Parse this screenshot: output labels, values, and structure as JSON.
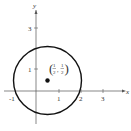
{
  "diagram": {
    "type": "coordinate-plane-circle",
    "axes": {
      "x_label": "x",
      "y_label": "y",
      "x_ticks": [
        "-1",
        "1",
        "2",
        "3"
      ],
      "y_ticks": [
        "1",
        "3"
      ]
    },
    "circle": {
      "center": [
        0.5,
        0.5
      ],
      "radius": 1.58,
      "stroke": "#111111"
    },
    "point": {
      "coords": [
        0.5,
        0.5
      ],
      "label_x_num": "1",
      "label_x_den": "2",
      "label_y_num": "1",
      "label_y_den": "2"
    }
  }
}
